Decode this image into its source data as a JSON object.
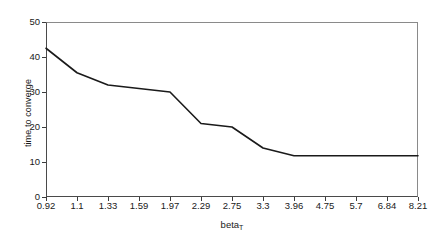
{
  "chart_data": {
    "type": "line",
    "title": "",
    "xlabel": "beta",
    "xlabel_sub": "T",
    "ylabel": "time to converge",
    "categories": [
      "0.92",
      "1.1",
      "1.33",
      "1.59",
      "1.97",
      "2.29",
      "2.75",
      "3.3",
      "3.96",
      "4.75",
      "5.7",
      "6.84",
      "8.21"
    ],
    "values": [
      42.5,
      35.5,
      32,
      31,
      30,
      21,
      20,
      14,
      11.8,
      11.8,
      11.8,
      11.8,
      11.8
    ],
    "series": [
      {
        "name": "time to converge",
        "values": [
          42.5,
          35.5,
          32,
          31,
          30,
          21,
          20,
          14,
          11.8,
          11.8,
          11.8,
          11.8,
          11.8
        ]
      }
    ],
    "yticks": [
      "0",
      "10",
      "20",
      "30",
      "40",
      "50"
    ],
    "ytick_values": [
      0,
      10,
      20,
      30,
      40,
      50
    ],
    "ylim": [
      0,
      50
    ],
    "xlim": [
      0,
      12
    ],
    "grid": false,
    "legend": "none",
    "line_color": "#1a1a1a",
    "background_color": "#ffffff",
    "frame_color": "#4a4a4a"
  }
}
